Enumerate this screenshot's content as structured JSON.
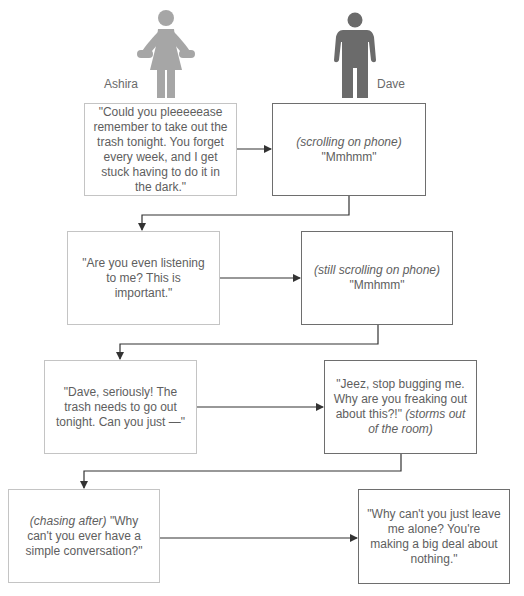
{
  "characters": {
    "ashira": {
      "name": "Ashira",
      "color": "#a6a6a6"
    },
    "dave": {
      "name": "Dave",
      "color": "#6b6b6b"
    }
  },
  "exchanges": [
    {
      "ashira": {
        "text": "\"Could you pleeeeease remember to take out the trash tonight. You forget every week, and I get stuck having to do it in the dark.\""
      },
      "dave": {
        "action": "(scrolling on phone)",
        "text": "\"Mmhmm\""
      }
    },
    {
      "ashira": {
        "text": "\"Are you even listening to me? This is important.\""
      },
      "dave": {
        "action": "(still scrolling on phone)",
        "text": "\"Mmhmm\""
      }
    },
    {
      "ashira": {
        "text": "\"Dave, seriously! The trash needs to go out tonight. Can you just —\""
      },
      "dave": {
        "text": "\"Jeez, stop bugging me. Why are you freaking out about this?!\"",
        "action": "(storms out of the room)"
      }
    },
    {
      "ashira": {
        "action": "(chasing after)",
        "text": "\"Why can't you ever have a simple conversation?\""
      },
      "dave": {
        "text": "\"Why can't you just leave me alone? You're making a big deal about nothing.\""
      }
    }
  ],
  "colors": {
    "box_border_ashira": "#c4c4c4",
    "box_border_dave": "#6e6e6e",
    "arrow": "#333333"
  }
}
